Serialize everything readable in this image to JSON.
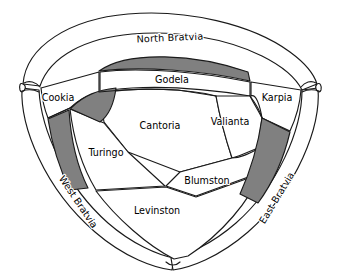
{
  "figure": {
    "kind": "schematic-map",
    "background_color": "#ffffff",
    "line_color": "#1a1a1a",
    "shaded_color": "#808080",
    "label_color": "#000000"
  },
  "map": {
    "outer_regions": [
      {
        "id": "north-bratvia",
        "label": "North Bratvia",
        "orientation": "arched",
        "shaded": false
      },
      {
        "id": "west-bratvia",
        "label": "West Bratvia",
        "orientation": "rotated",
        "shaded": false
      },
      {
        "id": "east-bratvia",
        "label": "East Bratvia",
        "orientation": "rotated",
        "shaded": false
      }
    ],
    "inner_regions": [
      {
        "id": "cookia",
        "label": "Cookia",
        "shaded": false
      },
      {
        "id": "godela",
        "label": "Godela",
        "shaded": false
      },
      {
        "id": "karpia",
        "label": "Karpia",
        "shaded": false
      },
      {
        "id": "cantoria",
        "label": "Cantoria",
        "shaded": false
      },
      {
        "id": "valianta",
        "label": "Valianta",
        "shaded": false
      },
      {
        "id": "turingo",
        "label": "Turingo",
        "shaded": false
      },
      {
        "id": "blumston",
        "label": "Blumston",
        "shaded": false
      },
      {
        "id": "levinston",
        "label": "Levinston",
        "shaded": false
      }
    ],
    "shaded_regions": [
      {
        "id": "shaded-north-strip",
        "description": "long shaded lens below North Bratvia"
      },
      {
        "id": "shaded-cookia-wedge",
        "description": "shaded curved wedge below Cookia"
      },
      {
        "id": "shaded-turingo-strip",
        "description": "shaded vertical strip left of Turingo"
      },
      {
        "id": "shaded-east-strip",
        "description": "shaded diagonal strip left of East Bratvia"
      }
    ]
  },
  "labels": {
    "north_bratvia": "North Bratvia",
    "west_bratvia": "West Bratvia",
    "east_bratvia": "East Bratvia",
    "cookia": "Cookia",
    "godela": "Godela",
    "karpia": "Karpia",
    "cantoria": "Cantoria",
    "valianta": "Valianta",
    "turingo": "Turingo",
    "blumston": "Blumston",
    "levinston": "Levinston"
  }
}
